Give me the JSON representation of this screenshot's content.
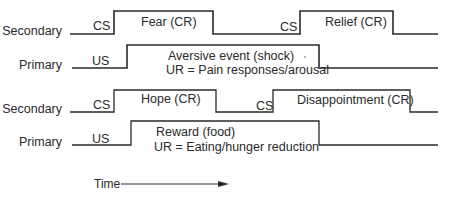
{
  "diagram": {
    "rows": [
      {
        "label": "Secondary",
        "stimulus": "CS",
        "events": [
          {
            "label": "Fear (CR)"
          },
          {
            "stimulus": "CS",
            "label": "Relief (CR)"
          }
        ]
      },
      {
        "label": "Primary",
        "stimulus": "US",
        "events": [
          {
            "label": "Aversive event (shock)",
            "sublabel": "UR = Pain responses/arousal"
          }
        ]
      },
      {
        "label": "Secondary",
        "stimulus": "CS",
        "events": [
          {
            "label": "Hope (CR)"
          },
          {
            "stimulus": "CS",
            "label": "Disappointment (CR)"
          }
        ]
      },
      {
        "label": "Primary",
        "stimulus": "US",
        "events": [
          {
            "label": "Reward (food)",
            "sublabel": "UR = Eating/hunger reduction"
          }
        ]
      }
    ],
    "time_axis": {
      "label": "Time"
    },
    "line_color": "#2a2a2a"
  }
}
